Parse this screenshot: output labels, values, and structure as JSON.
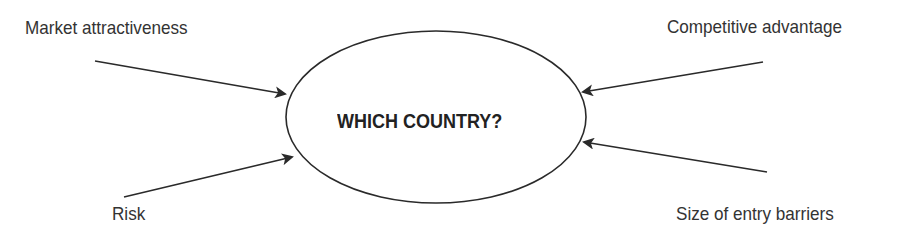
{
  "diagram": {
    "type": "influence-diagram",
    "center": {
      "label": "WHICH COUNTRY?",
      "shape": "ellipse",
      "cx": 436,
      "cy": 117,
      "rx": 150,
      "ry": 86
    },
    "factors": [
      {
        "id": "market",
        "label": "Market attractiveness",
        "position": "top-left",
        "arrow": {
          "x1": 95,
          "y1": 61,
          "x2": 285,
          "y2": 94
        }
      },
      {
        "id": "competitive",
        "label": "Competitive advantage",
        "position": "top-right",
        "arrow": {
          "x1": 763,
          "y1": 62,
          "x2": 583,
          "y2": 92
        }
      },
      {
        "id": "risk",
        "label": "Risk",
        "position": "bottom-left",
        "arrow": {
          "x1": 124,
          "y1": 197,
          "x2": 292,
          "y2": 157
        }
      },
      {
        "id": "barriers",
        "label": "Size of entry barriers",
        "position": "bottom-right",
        "arrow": {
          "x1": 767,
          "y1": 172,
          "x2": 584,
          "y2": 142
        }
      }
    ],
    "colors": {
      "stroke": "#2a2a2a",
      "text": "#333333",
      "background": "#ffffff"
    }
  }
}
